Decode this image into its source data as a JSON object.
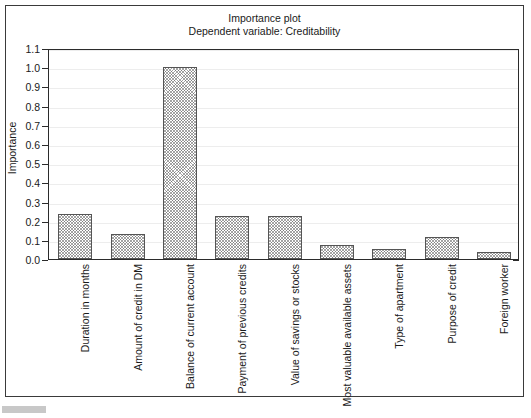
{
  "figure": {
    "title_main": "Importance plot",
    "title_sub": "Dependent variable: Creditability"
  },
  "chart_data": {
    "type": "bar",
    "title": "Importance plot",
    "subtitle": "Dependent variable: Creditability",
    "xlabel": "",
    "ylabel": "Importance",
    "ylim": [
      0.0,
      1.1
    ],
    "yticks": [
      "0.0",
      "0.1",
      "0.2",
      "0.3",
      "0.4",
      "0.5",
      "0.6",
      "0.7",
      "0.8",
      "0.9",
      "1.0",
      "1.1"
    ],
    "ytick_values": [
      0.0,
      0.1,
      0.2,
      0.3,
      0.4,
      0.5,
      0.6,
      0.7,
      0.8,
      0.9,
      1.0,
      1.1
    ],
    "grid": true,
    "legend": false,
    "categories": [
      "Duration in months",
      "Amount of credit in DM",
      "Balance of current account",
      "Payment of previous credits",
      "Value of savings or stocks",
      "Most valuable available assets",
      "Type of apartment",
      "Purpose of credit",
      "Foreign worker"
    ],
    "values": [
      0.235,
      0.13,
      1.0,
      0.225,
      0.225,
      0.075,
      0.055,
      0.115,
      0.035
    ],
    "bar_fill": "hatched-crosshatch",
    "bar_edge_color": "#555555"
  }
}
